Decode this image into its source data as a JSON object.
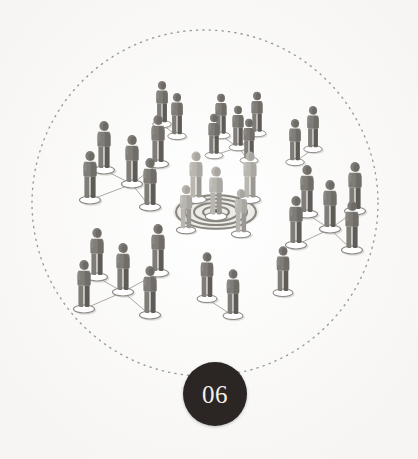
{
  "illustration": {
    "title": "Network clusters around central target",
    "background_color": "#fefefe",
    "boundary": {
      "name": "dotted-circle-boundary",
      "shape": "circle",
      "center_x": 205,
      "center_y": 203,
      "radius": 173,
      "stroke_color": "#9a9a9a",
      "stroke_width": 1.4,
      "dash": "1.2 5.2"
    },
    "target": {
      "name": "bullseye-target",
      "center_x": 216,
      "center_y": 212,
      "rings": 4,
      "ring_color": "#7f7c77",
      "fill_color": "#e9e7e2",
      "center_dot_color": "#4a4744",
      "ry_ratio": 0.42,
      "radii": [
        40,
        31,
        22,
        13
      ],
      "center_dot_r": 6
    },
    "figure_colors": {
      "outer_body": "#807d78",
      "outer_shadow": "#5f5c58",
      "outer_highlight": "#94918c",
      "center_body": "#b9b6b0",
      "center_shadow": "#9b9893",
      "center_highlight": "#cbc8c3",
      "base_ring": "#8d8a85",
      "link_line": "#a9a6a1",
      "ground_shadow": "rgba(120,117,112,0.22)"
    },
    "groups": [
      {
        "name": "cluster-upper-left",
        "kind": "cluster",
        "tone": "outer",
        "figures": [
          {
            "x": 104,
            "y": 146,
            "s": 1.0
          },
          {
            "x": 132,
            "y": 160,
            "s": 1.0
          },
          {
            "x": 158,
            "y": 140,
            "s": 1.0
          },
          {
            "x": 90,
            "y": 176,
            "s": 1.0
          },
          {
            "x": 150,
            "y": 183,
            "s": 1.0
          }
        ],
        "links": [
          [
            0,
            1
          ],
          [
            1,
            2
          ],
          [
            1,
            3
          ],
          [
            1,
            4
          ]
        ]
      },
      {
        "name": "cluster-lower-left",
        "kind": "cluster",
        "tone": "outer",
        "figures": [
          {
            "x": 97,
            "y": 253,
            "s": 1.0
          },
          {
            "x": 123,
            "y": 268,
            "s": 1.0
          },
          {
            "x": 158,
            "y": 249,
            "s": 1.0
          },
          {
            "x": 84,
            "y": 285,
            "s": 1.0
          },
          {
            "x": 150,
            "y": 291,
            "s": 1.0
          }
        ],
        "links": [
          [
            0,
            1
          ],
          [
            1,
            2
          ],
          [
            1,
            3
          ],
          [
            1,
            4
          ]
        ]
      },
      {
        "name": "cluster-right",
        "kind": "cluster",
        "tone": "outer",
        "figures": [
          {
            "x": 307,
            "y": 190,
            "s": 1.0
          },
          {
            "x": 330,
            "y": 205,
            "s": 1.0
          },
          {
            "x": 355,
            "y": 187,
            "s": 1.0
          },
          {
            "x": 296,
            "y": 221,
            "s": 1.0
          },
          {
            "x": 352,
            "y": 226,
            "s": 1.0
          }
        ],
        "links": [
          [
            0,
            1
          ],
          [
            1,
            2
          ],
          [
            1,
            3
          ],
          [
            1,
            4
          ]
        ]
      },
      {
        "name": "cluster-top-center",
        "kind": "cluster",
        "tone": "outer",
        "figures": [
          {
            "x": 221,
            "y": 115,
            "s": 0.85
          },
          {
            "x": 238,
            "y": 127,
            "s": 0.85
          },
          {
            "x": 257,
            "y": 113,
            "s": 0.85
          },
          {
            "x": 214,
            "y": 135,
            "s": 0.85
          },
          {
            "x": 249,
            "y": 140,
            "s": 0.85
          }
        ],
        "links": [
          [
            0,
            1
          ],
          [
            1,
            2
          ],
          [
            1,
            3
          ],
          [
            1,
            4
          ]
        ]
      },
      {
        "name": "pair-top-left",
        "kind": "pair",
        "tone": "outer",
        "figures": [
          {
            "x": 162,
            "y": 103,
            "s": 0.88
          },
          {
            "x": 177,
            "y": 115,
            "s": 0.88
          }
        ],
        "links": [
          [
            0,
            1
          ]
        ]
      },
      {
        "name": "pair-top-right",
        "kind": "pair",
        "tone": "outer",
        "figures": [
          {
            "x": 313,
            "y": 128,
            "s": 0.88
          },
          {
            "x": 295,
            "y": 141,
            "s": 0.88
          }
        ],
        "links": [
          [
            0,
            1
          ]
        ]
      },
      {
        "name": "pair-bottom-center",
        "kind": "pair",
        "tone": "outer",
        "figures": [
          {
            "x": 207,
            "y": 276,
            "s": 0.95
          },
          {
            "x": 233,
            "y": 293,
            "s": 0.95
          }
        ],
        "links": [
          [
            0,
            1
          ]
        ]
      },
      {
        "name": "single-bottom-right",
        "kind": "single",
        "tone": "outer",
        "figures": [
          {
            "x": 283,
            "y": 270,
            "s": 0.95
          }
        ],
        "links": []
      },
      {
        "name": "center-figures",
        "kind": "center-ring",
        "tone": "center",
        "figures": [
          {
            "x": 196,
            "y": 176,
            "s": 0.98
          },
          {
            "x": 250,
            "y": 176,
            "s": 0.98
          },
          {
            "x": 216,
            "y": 192,
            "s": 1.02
          },
          {
            "x": 186,
            "y": 208,
            "s": 0.92
          },
          {
            "x": 241,
            "y": 212,
            "s": 0.92
          }
        ],
        "links": []
      }
    ]
  },
  "badge": {
    "name": "section-number-badge",
    "number": "06",
    "background_color": "#2b2523",
    "text_color": "#f4f1ec",
    "diameter": 64,
    "center_x": 215,
    "center_y": 394
  }
}
